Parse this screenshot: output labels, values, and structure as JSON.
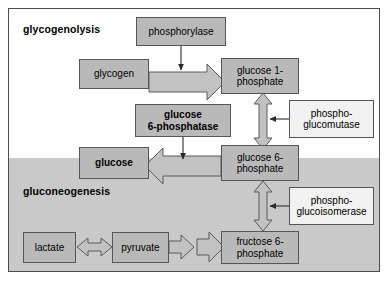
{
  "figure": {
    "sections": [
      {
        "id": "glycogenolysis",
        "label": "glycogenolysis"
      },
      {
        "id": "gluconeogenesis",
        "label": "gluconeogenesis"
      }
    ],
    "colors": {
      "metabolite_fill": "#b9b9b9",
      "enzyme_fill": "#f2f2f2",
      "band_fill": "#c9c9c9",
      "outline": "#565656",
      "frame": "#4d4d4d",
      "arrow_fill": "#c2c2c2",
      "arrow_outline": "#5a5a5a",
      "text": "#000000"
    },
    "nodes": [
      {
        "id": "phosphorylase",
        "label": "phosphorylase",
        "kind": "enzyme",
        "style": "grey",
        "bold": false
      },
      {
        "id": "glycogen",
        "label": "glycogen",
        "kind": "metabolite",
        "style": "grey",
        "bold": false
      },
      {
        "id": "glucose-1-phosphate",
        "label": "glucose 1-\nphosphate",
        "kind": "metabolite",
        "style": "grey",
        "bold": false
      },
      {
        "id": "glucose-6-phosphatase",
        "label": "glucose\n6-phosphatase",
        "kind": "enzyme",
        "style": "grey",
        "bold": true
      },
      {
        "id": "phosphoglucomutase",
        "label": "phospho-\nglucomutase",
        "kind": "enzyme",
        "style": "white",
        "bold": false
      },
      {
        "id": "glucose",
        "label": "glucose",
        "kind": "metabolite",
        "style": "grey",
        "bold": true
      },
      {
        "id": "glucose-6-phosphate",
        "label": "glucose 6-\nphosphate",
        "kind": "metabolite",
        "style": "grey",
        "bold": false
      },
      {
        "id": "phosphoglucoisomerase",
        "label": "phospho-\nglucoisomerase",
        "kind": "enzyme",
        "style": "white",
        "bold": false
      },
      {
        "id": "lactate",
        "label": "lactate",
        "kind": "metabolite",
        "style": "grey",
        "bold": false
      },
      {
        "id": "pyruvate",
        "label": "pyruvate",
        "kind": "metabolite",
        "style": "grey",
        "bold": false
      },
      {
        "id": "fructose-6-phosphate",
        "label": "fructose 6-\nphosphate",
        "kind": "metabolite",
        "style": "grey",
        "bold": false
      }
    ],
    "edges": [
      {
        "id": "glycogen-to-glucose-1-phosphate",
        "from": "glycogen",
        "to": "glucose-1-phosphate",
        "style": "block-arrow",
        "direction": "right"
      },
      {
        "id": "phosphorylase-to-glycogen-reaction",
        "from": "phosphorylase",
        "to": "glycogen-to-glucose-1-phosphate",
        "style": "thin-arrow",
        "direction": "down"
      },
      {
        "id": "glucose-1-phosphate-to-glucose-6-phosphate",
        "from": "glucose-1-phosphate",
        "to": "glucose-6-phosphate",
        "style": "block-arrow-double",
        "direction": "vertical"
      },
      {
        "id": "phosphoglucomutase-to-reaction",
        "from": "phosphoglucomutase",
        "to": "glucose-1-phosphate-to-glucose-6-phosphate",
        "style": "thin-arrow",
        "direction": "left"
      },
      {
        "id": "glucose-6-phosphate-to-glucose",
        "from": "glucose-6-phosphate",
        "to": "glucose",
        "style": "block-arrow",
        "direction": "left"
      },
      {
        "id": "glucose-6-phosphatase-to-reaction",
        "from": "glucose-6-phosphatase",
        "to": "glucose-6-phosphate-to-glucose",
        "style": "thin-arrow",
        "direction": "down"
      },
      {
        "id": "fructose-6-phosphate-to-glucose-6-phosphate",
        "from": "fructose-6-phosphate",
        "to": "glucose-6-phosphate",
        "style": "block-arrow-double",
        "direction": "vertical"
      },
      {
        "id": "phosphoglucoisomerase-to-reaction",
        "from": "phosphoglucoisomerase",
        "to": "fructose-6-phosphate-to-glucose-6-phosphate",
        "style": "thin-arrow",
        "direction": "left"
      },
      {
        "id": "lactate-to-pyruvate",
        "from": "lactate",
        "to": "pyruvate",
        "style": "block-arrow-double",
        "direction": "horizontal"
      },
      {
        "id": "pyruvate-to-fructose-6-phosphate-1",
        "from": "pyruvate",
        "to": "fructose-6-phosphate",
        "style": "block-arrow",
        "direction": "right"
      },
      {
        "id": "pyruvate-to-fructose-6-phosphate-2",
        "from": "pyruvate",
        "to": "fructose-6-phosphate",
        "style": "block-arrow",
        "direction": "right"
      }
    ]
  }
}
